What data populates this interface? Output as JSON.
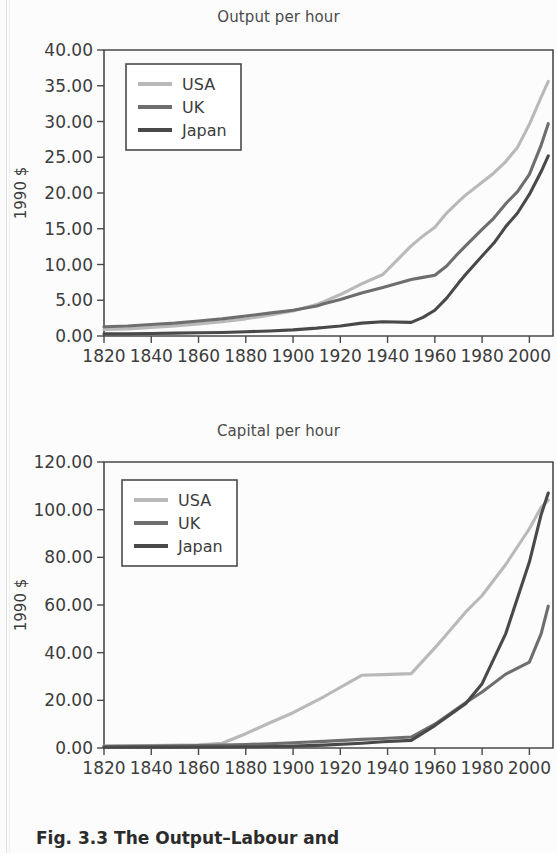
{
  "figure": {
    "caption_label": "Fig. 3.3",
    "caption_text": "The Output–Labour and"
  },
  "colors": {
    "usa": "#b9b9b9",
    "uk": "#6e6e6e",
    "japan": "#494949",
    "axis": "#4a4a4a",
    "text": "#3c3c3c",
    "page_background": "#fcfcfc"
  },
  "legend": {
    "entries": [
      {
        "label": "USA",
        "color_key": "usa"
      },
      {
        "label": "UK",
        "color_key": "uk"
      },
      {
        "label": "Japan",
        "color_key": "japan"
      }
    ]
  },
  "chart_data": [
    {
      "id": "output-per-hour",
      "type": "line",
      "title": "Output per hour",
      "xlabel": "",
      "ylabel": "1990 $",
      "xlim": [
        1820,
        2010
      ],
      "ylim": [
        0,
        40
      ],
      "grid": false,
      "legend_position": "top-left",
      "xticks": [
        1820,
        1840,
        1860,
        1880,
        1900,
        1920,
        1940,
        1960,
        1980,
        2000
      ],
      "yticks": [
        0,
        5,
        10,
        15,
        20,
        25,
        30,
        35,
        40
      ],
      "ytick_labels": [
        "0.00",
        "5.00",
        "10.00",
        "15.00",
        "20.00",
        "25.00",
        "30.00",
        "35.00",
        "40.00"
      ],
      "xtick_labels": [
        "1820",
        "1840",
        "1860",
        "1880",
        "1900",
        "1920",
        "1940",
        "1960",
        "1980",
        "2000"
      ],
      "x": [
        1820,
        1830,
        1840,
        1850,
        1860,
        1870,
        1880,
        1890,
        1900,
        1910,
        1913,
        1920,
        1929,
        1938,
        1950,
        1955,
        1960,
        1965,
        1970,
        1973,
        1980,
        1985,
        1990,
        1995,
        2000,
        2005,
        2008
      ],
      "series": [
        {
          "name": "USA",
          "color_key": "usa",
          "values": [
            0.9,
            1.0,
            1.2,
            1.4,
            1.7,
            2.0,
            2.4,
            2.9,
            3.5,
            4.4,
            4.8,
            5.8,
            7.3,
            8.6,
            12.6,
            14.0,
            15.2,
            17.2,
            18.8,
            19.7,
            21.5,
            22.8,
            24.4,
            26.4,
            29.6,
            33.4,
            35.6
          ]
        },
        {
          "name": "UK",
          "color_key": "uk",
          "values": [
            1.3,
            1.4,
            1.6,
            1.8,
            2.1,
            2.4,
            2.8,
            3.2,
            3.6,
            4.2,
            4.5,
            5.1,
            6.0,
            6.8,
            7.9,
            8.2,
            8.5,
            9.8,
            11.6,
            12.6,
            14.9,
            16.5,
            18.5,
            20.2,
            22.6,
            26.7,
            29.7
          ]
        },
        {
          "name": "Japan",
          "color_key": "japan",
          "values": [
            0.3,
            0.3,
            0.35,
            0.4,
            0.45,
            0.5,
            0.6,
            0.7,
            0.85,
            1.1,
            1.2,
            1.4,
            1.8,
            2.0,
            1.9,
            2.6,
            3.6,
            5.3,
            7.4,
            8.6,
            11.2,
            13.0,
            15.3,
            17.2,
            19.8,
            23.0,
            25.2
          ]
        }
      ]
    },
    {
      "id": "capital-per-hour",
      "type": "line",
      "title": "Capital per hour",
      "xlabel": "",
      "ylabel": "1990 $",
      "xlim": [
        1820,
        2010
      ],
      "ylim": [
        0,
        120
      ],
      "grid": false,
      "legend_position": "top-left",
      "xticks": [
        1820,
        1840,
        1860,
        1880,
        1900,
        1920,
        1940,
        1960,
        1980,
        2000
      ],
      "yticks": [
        0,
        20,
        40,
        60,
        80,
        100,
        120
      ],
      "ytick_labels": [
        "0.00",
        "20.00",
        "40.00",
        "60.00",
        "80.00",
        "100.00",
        "120.00"
      ],
      "xtick_labels": [
        "1820",
        "1840",
        "1860",
        "1880",
        "1900",
        "1920",
        "1940",
        "1960",
        "1980",
        "2000"
      ],
      "x": [
        1820,
        1840,
        1860,
        1870,
        1880,
        1890,
        1900,
        1913,
        1929,
        1938,
        1950,
        1960,
        1973,
        1980,
        1990,
        2000,
        2005,
        2008
      ],
      "series": [
        {
          "name": "USA",
          "color_key": "usa",
          "values": [
            0.8,
            1.0,
            1.3,
            2.0,
            6.0,
            10.5,
            14.8,
            21.5,
            30.5,
            30.8,
            31.2,
            42.0,
            57.0,
            64.0,
            77.0,
            92.0,
            101.0,
            104.0
          ]
        },
        {
          "name": "UK",
          "color_key": "uk",
          "values": [
            0.7,
            0.8,
            1.0,
            1.2,
            1.5,
            1.8,
            2.2,
            2.8,
            3.6,
            4.0,
            4.6,
            10.0,
            19.0,
            23.5,
            31.0,
            36.0,
            48.0,
            59.5
          ]
        },
        {
          "name": "Japan",
          "color_key": "japan",
          "values": [
            0.3,
            0.35,
            0.4,
            0.45,
            0.5,
            0.6,
            0.8,
            1.2,
            2.0,
            2.6,
            3.2,
            9.4,
            18.6,
            27.0,
            48.0,
            78.0,
            98.0,
            107.0
          ]
        }
      ]
    }
  ]
}
